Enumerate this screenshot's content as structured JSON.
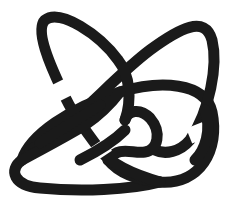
{
  "figure": {
    "type": "knot-diagram",
    "stroke_color": "#1a1a1a",
    "background_color": "#ffffff",
    "components": [
      {
        "name": "top-left-petal"
      },
      {
        "name": "upper-arch"
      },
      {
        "name": "middle-ellipse"
      },
      {
        "name": "inner-small-loop"
      },
      {
        "name": "lower-ellipse"
      }
    ]
  }
}
